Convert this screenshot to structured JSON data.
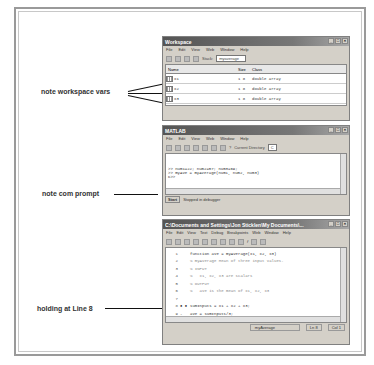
{
  "annotations": {
    "workspace": "note workspace vars",
    "prompt": "note com prompt",
    "line8": "holding at Line 8"
  },
  "workspace_window": {
    "title": "Workspace",
    "menu": [
      "File",
      "Edit",
      "View",
      "Web",
      "Window",
      "Help"
    ],
    "stack_label": "Stack:",
    "stack_value": "myaverage",
    "columns": [
      "Name",
      "Size",
      "Class"
    ],
    "rows": [
      {
        "name": "x1",
        "size": "1 8",
        "class": "double array"
      },
      {
        "name": "x2",
        "size": "1 8",
        "class": "double array"
      },
      {
        "name": "x3",
        "size": "1 8",
        "class": "double array"
      }
    ]
  },
  "matlab_window": {
    "title": "MATLAB",
    "menu": [
      "File",
      "Edit",
      "View",
      "Web",
      "Window",
      "Help"
    ],
    "current_dir_label": "Current Directory",
    "current_dir_value": "C",
    "lines": [
      ">> num1=22; num2=57; num3=69;",
      ">> myAve = myAverage(num1, num2, num3)",
      "K>>"
    ],
    "start_label": "Start",
    "status": "Stopped in debugger"
  },
  "editor_window": {
    "title": "C:\\Documents and Settings\\Jon Sticklen\\My Documents\\...",
    "menu": [
      "File",
      "Edit",
      "View",
      "Text",
      "Debug",
      "Breakpoints",
      "Web",
      "Window",
      "Help"
    ],
    "code": [
      {
        "n": "1",
        "g": "",
        "text": "function ave = myAverage(x1, x2, x3)",
        "comment": false
      },
      {
        "n": "2",
        "g": "",
        "text": "% myAverage Mean of three input values.",
        "comment": true
      },
      {
        "n": "3",
        "g": "",
        "text": "% INPUT",
        "comment": true
      },
      {
        "n": "4",
        "g": "",
        "text": "%   x1, x2, x3 are scalars",
        "comment": true
      },
      {
        "n": "5",
        "g": "",
        "text": "% OUTPUT",
        "comment": true
      },
      {
        "n": "6",
        "g": "",
        "text": "%   ave is the mean of x1, x2, x3",
        "comment": true
      },
      {
        "n": "7",
        "g": "",
        "text": "",
        "comment": false
      },
      {
        "n": "8",
        "g": "● ●",
        "text": "sumInputs = x1 + x2 + x3;",
        "comment": false
      },
      {
        "n": "9",
        "g": "-",
        "text": "ave = sumInputs/3;",
        "comment": false
      }
    ],
    "status_func": "myAverage",
    "status_ln": "Ln 8",
    "status_col": "Col 1"
  }
}
